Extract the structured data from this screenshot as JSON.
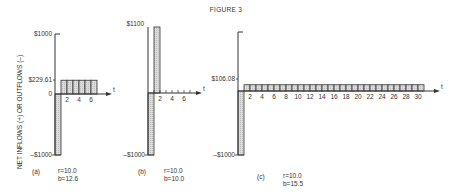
{
  "figure_title": "FIGURE 3",
  "ylabel": "NET INFLOWS (+) OR OUTFLOWS (–)",
  "colors": {
    "bar_fill": "#d9d9d9",
    "line": "#333333",
    "background": "#ffffff"
  },
  "chart_data": [
    {
      "type": "bar",
      "panel": "(a)",
      "caption_r": "r=10.0",
      "caption_b": "b=12.6",
      "xlabel": "t",
      "ylabel": "NET INFLOWS (+) OR OUTFLOWS (–)",
      "y_tick_labels": [
        "$1000",
        "$229.61",
        "0",
        "–$1000"
      ],
      "x_tick_labels": [
        "2",
        "4",
        "6"
      ],
      "categories": [
        0,
        1,
        2,
        3,
        4,
        5,
        6
      ],
      "values": [
        -1000,
        229.61,
        229.61,
        229.61,
        229.61,
        229.61,
        229.61
      ],
      "ylim": [
        -1000,
        1000
      ]
    },
    {
      "type": "bar",
      "panel": "(b)",
      "caption_r": "r=10.0",
      "caption_b": "b=10.0",
      "xlabel": "t",
      "y_tick_labels": [
        "$1100",
        "–$1000"
      ],
      "x_tick_labels": [
        "2",
        "4",
        "6"
      ],
      "categories": [
        0,
        1,
        2,
        3,
        4,
        5,
        6
      ],
      "values": [
        -1000,
        1100,
        0,
        0,
        0,
        0,
        0
      ],
      "ylim": [
        -1000,
        1100
      ]
    },
    {
      "type": "bar",
      "panel": "(c)",
      "caption_r": "r=10.0",
      "caption_b": "b=15.5",
      "xlabel": "t",
      "y_tick_labels": [
        "$106.08",
        "–$1000"
      ],
      "x_tick_labels": [
        "2",
        "4",
        "6",
        "8",
        "10",
        "12",
        "14",
        "16",
        "18",
        "20",
        "22",
        "24",
        "26",
        "28",
        "30"
      ],
      "categories": [
        0,
        1,
        2,
        3,
        4,
        5,
        6,
        7,
        8,
        9,
        10,
        11,
        12,
        13,
        14,
        15,
        16,
        17,
        18,
        19,
        20,
        21,
        22,
        23,
        24,
        25,
        26,
        27,
        28,
        29,
        30
      ],
      "values": [
        -1000,
        106.08,
        106.08,
        106.08,
        106.08,
        106.08,
        106.08,
        106.08,
        106.08,
        106.08,
        106.08,
        106.08,
        106.08,
        106.08,
        106.08,
        106.08,
        106.08,
        106.08,
        106.08,
        106.08,
        106.08,
        106.08,
        106.08,
        106.08,
        106.08,
        106.08,
        106.08,
        106.08,
        106.08,
        106.08,
        106.08
      ],
      "ylim": [
        -1000,
        1000
      ]
    }
  ]
}
